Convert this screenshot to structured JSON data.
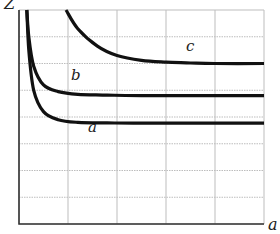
{
  "chart_data": {
    "type": "line",
    "title": "",
    "xlabel": "a",
    "ylabel": "Z",
    "grid": true,
    "legend": "none (inline curve labels)",
    "x_ticks": [],
    "y_ticks": [],
    "grid_divisions": {
      "x": 5,
      "y": 8
    },
    "xlim": [
      0,
      5
    ],
    "ylim": [
      0,
      8
    ],
    "series": [
      {
        "name": "a",
        "label_position": [
          1.5,
          3.5
        ],
        "x": [
          0.16,
          0.2,
          0.3,
          0.5,
          0.8,
          1.2,
          1.8,
          2.5,
          5
        ],
        "y": [
          8,
          6.5,
          5.0,
          4.2,
          3.9,
          3.8,
          3.78,
          3.77,
          3.77
        ]
      },
      {
        "name": "b",
        "label_position": [
          1.15,
          5.2
        ],
        "x": [
          0.16,
          0.2,
          0.3,
          0.5,
          0.8,
          1.2,
          1.8,
          2.5,
          5
        ],
        "y": [
          8,
          7.0,
          5.9,
          5.2,
          4.95,
          4.85,
          4.82,
          4.8,
          4.8
        ]
      },
      {
        "name": "c",
        "label_position": [
          3.45,
          6.5
        ],
        "x": [
          0.96,
          1.2,
          1.6,
          2.0,
          2.5,
          3.0,
          3.5,
          4.0,
          5
        ],
        "y": [
          8,
          7.3,
          6.65,
          6.3,
          6.12,
          6.05,
          6.02,
          6.0,
          6.0
        ]
      }
    ]
  },
  "labels": {
    "x_axis": "a",
    "y_axis": "Z",
    "curve_a": "a",
    "curve_b": "b",
    "curve_c": "c"
  },
  "colors": {
    "curve": "#111111",
    "grid": "#bdbdbd",
    "axis": "#333333"
  }
}
